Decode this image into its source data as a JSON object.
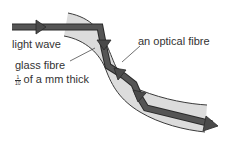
{
  "diagram": {
    "labels": {
      "light_wave": "light wave",
      "glass_fibre": "glass fibre",
      "thickness_numerator": "1",
      "thickness_denominator": "10",
      "thickness_text": "of a mm thick",
      "optical_fibre": "an optical fibre"
    },
    "colors": {
      "fibre_fill": "#dcdcdc",
      "fibre_edge": "#3a3a3a",
      "arrow": "#555555",
      "arrow_outline": "#2a2a2a",
      "text": "#333333"
    }
  }
}
